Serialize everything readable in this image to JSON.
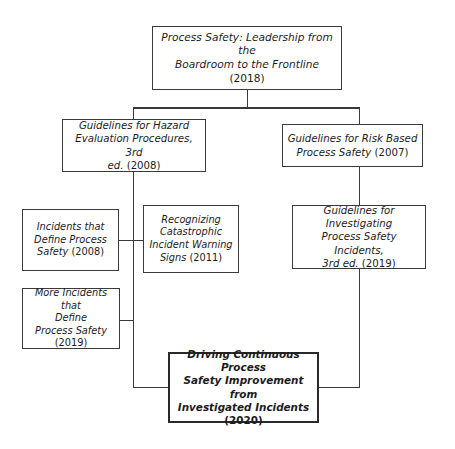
{
  "diagram": {
    "background_color": "#ffffff",
    "line_color": "#3a3a3a",
    "text_color": "#1c1c1c",
    "nodes": {
      "root": {
        "text": "Process Safety: Leadership from the\nBoardroom to the Frontline ",
        "year": "(2018)",
        "emphasis": "italic"
      },
      "hazard_eval": {
        "text": "Guidelines for Hazard\nEvaluation Procedures, 3rd\ned. ",
        "year": "(2008)",
        "emphasis": "italic"
      },
      "risk_based": {
        "text": "Guidelines for Risk Based\nProcess Safety ",
        "year": "(2007)",
        "emphasis": "italic"
      },
      "incidents_define": {
        "text": "Incidents that\nDefine Process\nSafety ",
        "year": "(2008)",
        "emphasis": "italic"
      },
      "recognizing": {
        "text": "Recognizing\nCatastrophic\nIncident Warning\nSigns ",
        "year": "(2011)",
        "emphasis": "italic"
      },
      "investigating": {
        "text": "Guidelines for Investigating\nProcess Safety Incidents,\n3rd ed. ",
        "year": "(2019)",
        "emphasis": "italic"
      },
      "more_incidents": {
        "text": "More Incidents that\nDefine\nProcess Safety\n",
        "year": "(2019)",
        "emphasis": "italic"
      },
      "driving": {
        "text": "Driving Continuous Process\nSafety Improvement from\nInvestigated Incidents\n",
        "year": "(2020)",
        "emphasis": "bold-italic"
      }
    }
  }
}
